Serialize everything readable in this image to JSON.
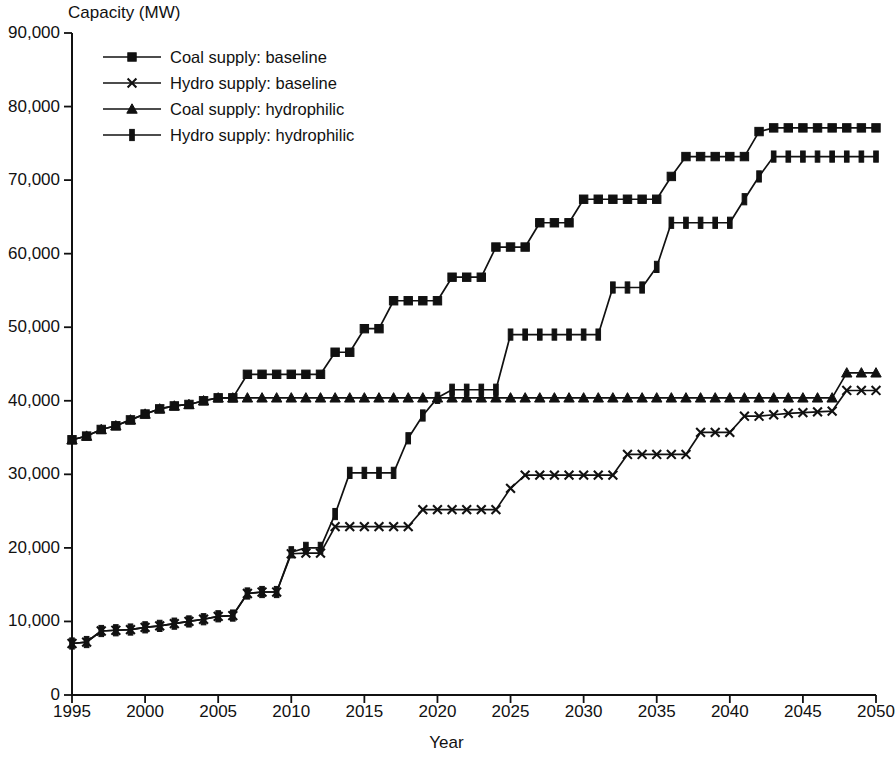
{
  "chart_data": {
    "type": "line",
    "title": "",
    "xlabel": "Year",
    "ylabel": "Capacity (MW)",
    "xlim": [
      1995,
      2050
    ],
    "ylim": [
      0,
      90000
    ],
    "xticks": [
      "1995",
      "2000",
      "2005",
      "2010",
      "2015",
      "2020",
      "2025",
      "2030",
      "2035",
      "2040",
      "2045",
      "2050"
    ],
    "xtick_values": [
      1995,
      2000,
      2005,
      2010,
      2015,
      2020,
      2025,
      2030,
      2035,
      2040,
      2045,
      2050
    ],
    "yticks": [
      "0",
      "10,000",
      "20,000",
      "30,000",
      "40,000",
      "50,000",
      "60,000",
      "70,000",
      "80,000",
      "90,000"
    ],
    "ytick_values": [
      0,
      10000,
      20000,
      30000,
      40000,
      50000,
      60000,
      70000,
      80000,
      90000
    ],
    "grid": false,
    "legend_position": "top-left",
    "x": [
      1995,
      1996,
      1997,
      1998,
      1999,
      2000,
      2001,
      2002,
      2003,
      2004,
      2005,
      2006,
      2007,
      2008,
      2009,
      2010,
      2011,
      2012,
      2013,
      2014,
      2015,
      2016,
      2017,
      2018,
      2019,
      2020,
      2021,
      2022,
      2023,
      2024,
      2025,
      2026,
      2027,
      2028,
      2029,
      2030,
      2031,
      2032,
      2033,
      2034,
      2035,
      2036,
      2037,
      2038,
      2039,
      2040,
      2041,
      2042,
      2043,
      2044,
      2045,
      2046,
      2047,
      2048,
      2049,
      2050
    ],
    "series": [
      {
        "name": "Coal supply: baseline",
        "marker": "square",
        "values": [
          34700,
          35200,
          36100,
          36600,
          37400,
          38200,
          38900,
          39300,
          39500,
          40000,
          40400,
          40400,
          43600,
          43600,
          43600,
          43600,
          43600,
          43600,
          46600,
          46600,
          49800,
          49800,
          53600,
          53600,
          53600,
          53600,
          56800,
          56800,
          56800,
          60900,
          60900,
          60900,
          64200,
          64200,
          64200,
          67400,
          67400,
          67400,
          67400,
          67400,
          67400,
          70500,
          73200,
          73200,
          73200,
          73200,
          73200,
          76600,
          77100,
          77100,
          77100,
          77100,
          77100,
          77100,
          77100,
          77100
        ]
      },
      {
        "name": "Hydro supply: baseline",
        "marker": "cross",
        "values": [
          7000,
          7200,
          8700,
          8800,
          8900,
          9200,
          9400,
          9700,
          10000,
          10300,
          10700,
          10800,
          13800,
          14000,
          14000,
          19200,
          19300,
          19300,
          22900,
          22900,
          22900,
          22900,
          22900,
          22900,
          25200,
          25200,
          25200,
          25200,
          25200,
          25200,
          28100,
          29900,
          29900,
          29900,
          29900,
          29900,
          29900,
          29900,
          32700,
          32700,
          32700,
          32700,
          32700,
          35700,
          35700,
          35700,
          37900,
          37900,
          38100,
          38300,
          38400,
          38500,
          38600,
          41400,
          41400,
          41400
        ]
      },
      {
        "name": "Coal supply: hydrophilic",
        "marker": "triangle",
        "values": [
          34700,
          35200,
          36100,
          36600,
          37400,
          38200,
          38900,
          39300,
          39500,
          40000,
          40400,
          40400,
          40400,
          40400,
          40400,
          40400,
          40400,
          40400,
          40400,
          40400,
          40400,
          40400,
          40400,
          40400,
          40400,
          40400,
          40400,
          40400,
          40400,
          40400,
          40400,
          40400,
          40400,
          40400,
          40400,
          40400,
          40400,
          40400,
          40400,
          40400,
          40400,
          40400,
          40400,
          40400,
          40400,
          40400,
          40400,
          40400,
          40400,
          40400,
          40400,
          40400,
          40400,
          43800,
          43800,
          43800
        ]
      },
      {
        "name": "Hydro supply: hydrophilic",
        "marker": "bar",
        "values": [
          7000,
          7200,
          8700,
          8800,
          8900,
          9200,
          9400,
          9700,
          10000,
          10300,
          10700,
          10800,
          13800,
          14000,
          14000,
          19400,
          20000,
          20000,
          24600,
          30200,
          30200,
          30200,
          30200,
          34900,
          38000,
          40400,
          41500,
          41500,
          41500,
          41500,
          49000,
          49000,
          49000,
          49000,
          49000,
          49000,
          49000,
          55400,
          55400,
          55400,
          58200,
          64200,
          64200,
          64200,
          64200,
          64200,
          67400,
          70500,
          73200,
          73200,
          73200,
          73200,
          73200,
          73200,
          73200,
          73200
        ]
      }
    ],
    "legend": [
      {
        "label": "Coal supply: baseline",
        "marker": "square"
      },
      {
        "label": "Hydro supply: baseline",
        "marker": "cross"
      },
      {
        "label": "Coal supply: hydrophilic",
        "marker": "triangle"
      },
      {
        "label": "Hydro supply: hydrophilic",
        "marker": "bar"
      }
    ],
    "color": "#111111"
  }
}
